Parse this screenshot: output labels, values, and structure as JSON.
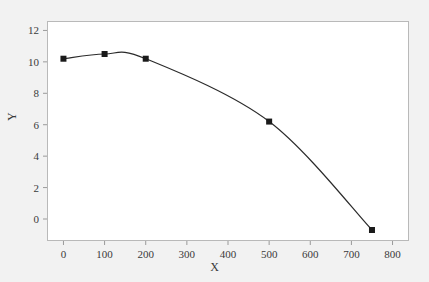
{
  "chart_data": {
    "type": "line",
    "title": "",
    "xlabel": "X",
    "ylabel": "Y",
    "xlim": [
      -40,
      840
    ],
    "ylim": [
      -1.4,
      12.6
    ],
    "xticks": [
      0,
      100,
      200,
      300,
      400,
      500,
      600,
      700,
      800
    ],
    "xtick_labels": [
      "0",
      "100",
      "200",
      "300",
      "400",
      "500",
      "600",
      "700",
      "800"
    ],
    "yticks": [
      0,
      2,
      4,
      6,
      8,
      10,
      12
    ],
    "ytick_labels": [
      "0",
      "2",
      "4",
      "6",
      "8",
      "10",
      "12"
    ],
    "grid": false,
    "legend": null,
    "series": [
      {
        "name": "series-1",
        "marker": "filled-square",
        "marker_color": "#1a1a1a",
        "line_color": "#2b2b2b",
        "x": [
          0,
          100,
          200,
          500,
          750
        ],
        "y": [
          10.2,
          10.5,
          10.2,
          6.2,
          -0.7
        ]
      }
    ]
  },
  "style": {
    "figure_background": "#f2f2f2",
    "plot_background": "#ffffff",
    "frame_color": "#b9b9b9",
    "tick_color": "#9a9a9a",
    "text_color": "#3a3a3a"
  }
}
